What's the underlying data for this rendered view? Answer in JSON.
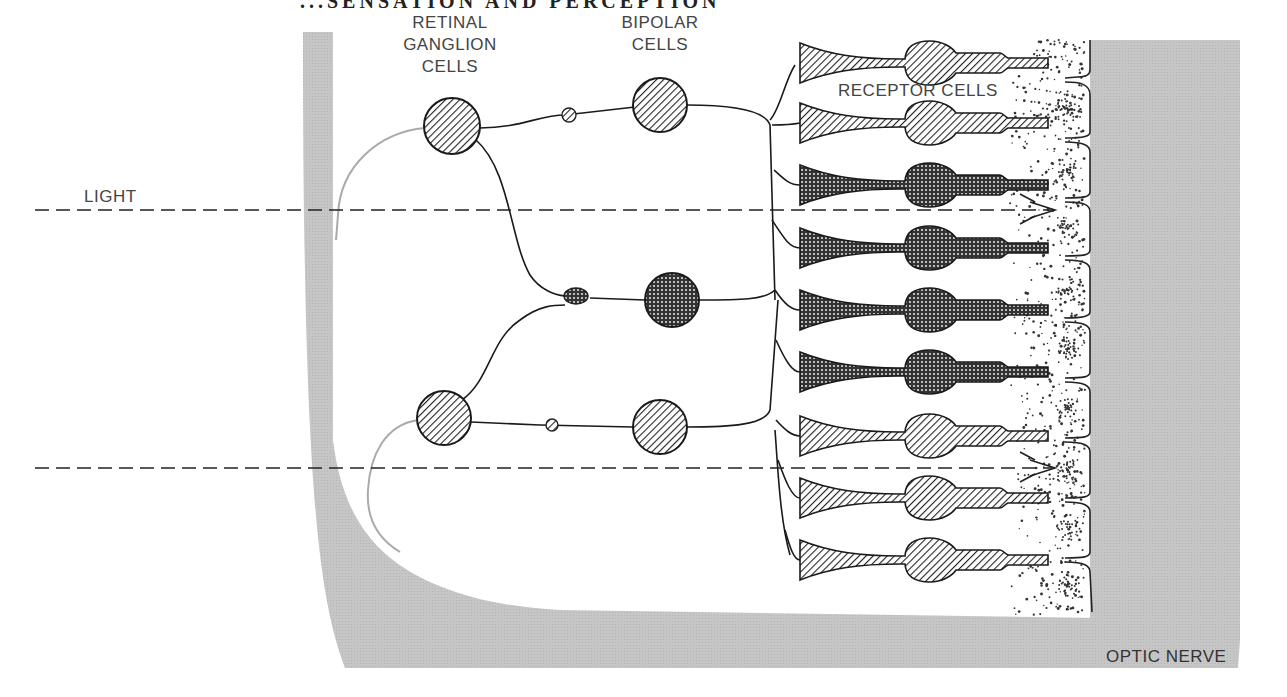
{
  "header": {
    "partial_title": "...SENSATION AND PERCEPTION"
  },
  "labels": {
    "ganglion": [
      "RETINAL",
      "GANGLION",
      "CELLS"
    ],
    "bipolar": [
      "BIPOLAR",
      "CELLS"
    ],
    "receptor": "RECEPTOR CELLS",
    "light": "LIGHT",
    "optic_nerve": "OPTIC NERVE"
  },
  "colors": {
    "tissue_gray": "#c4c4c4",
    "line": "#1a1a1a",
    "label": "#444444",
    "hatch_dark": "#2a2a2a",
    "stipple_dark": "#3a3a3a"
  },
  "cells": {
    "ganglion": [
      {
        "id": "g1",
        "cx": 452,
        "cy": 126,
        "r": 28,
        "fill": "hatch"
      },
      {
        "id": "g2",
        "cx": 444,
        "cy": 418,
        "r": 27,
        "fill": "hatch"
      }
    ],
    "bipolar": [
      {
        "id": "b1",
        "cx": 660,
        "cy": 105,
        "r": 27,
        "fill": "hatch"
      },
      {
        "id": "b2",
        "cx": 672,
        "cy": 300,
        "r": 27,
        "fill": "dots"
      },
      {
        "id": "b3",
        "cx": 660,
        "cy": 427,
        "r": 27,
        "fill": "hatch"
      }
    ],
    "receptors_y": [
      63,
      123,
      185,
      248,
      310,
      372,
      436,
      498,
      560
    ],
    "receptor_fill": [
      "hatch",
      "hatch",
      "dots",
      "dots",
      "dots",
      "dots",
      "hatch",
      "hatch",
      "hatch"
    ]
  },
  "light_rays": [
    {
      "y": 210,
      "x1": 35,
      "x2": 1055
    },
    {
      "y": 468,
      "x1": 35,
      "x2": 1055
    }
  ]
}
